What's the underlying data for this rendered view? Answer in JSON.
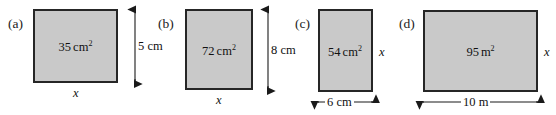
{
  "figure": {
    "kind": "geometry-exercise-rectangles",
    "background_color": "#ffffff",
    "rect_fill_color": "#c9c9c9",
    "rect_stroke_color": "#262626",
    "parts": [
      {
        "label": "(a)",
        "area_value": "35",
        "area_unit": "cm",
        "area_exponent": "2",
        "unknown_side": "x",
        "unknown_side_position": "bottom",
        "known_dimension": "5 cm",
        "known_dimension_position": "right"
      },
      {
        "label": "(b)",
        "area_value": "72",
        "area_unit": "cm",
        "area_exponent": "2",
        "unknown_side": "x",
        "unknown_side_position": "bottom",
        "known_dimension": "8 cm",
        "known_dimension_position": "right"
      },
      {
        "label": "(c)",
        "area_value": "54",
        "area_unit": "cm",
        "area_exponent": "2",
        "unknown_side": "x",
        "unknown_side_position": "right",
        "known_dimension": "6 cm",
        "known_dimension_position": "bottom"
      },
      {
        "label": "(d)",
        "area_value": "95",
        "area_unit": "m",
        "area_exponent": "2",
        "unknown_side": "x",
        "unknown_side_position": "right",
        "known_dimension": "10 m",
        "known_dimension_position": "bottom"
      }
    ]
  }
}
